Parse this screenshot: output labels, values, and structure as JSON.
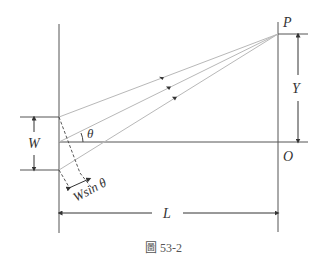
{
  "labels": {
    "P": "P",
    "O": "O",
    "Y": "Y",
    "W": "W",
    "L": "L",
    "theta": "θ",
    "w_sin_theta": "Wsin θ"
  },
  "caption": "圖 53-2",
  "colors": {
    "line": "#555555",
    "ray": "#b8b8b8",
    "text": "#333333"
  }
}
